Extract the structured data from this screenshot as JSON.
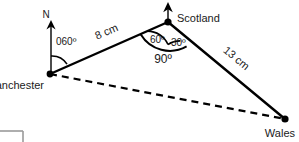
{
  "diagram": {
    "type": "bearings-triangle",
    "background_color": "#ffffff",
    "stroke_color": "#000000",
    "text_color": "#1a1a1a",
    "corner_mark_color": "#9a9a9a",
    "vertices": [
      {
        "id": "manchester",
        "label": "Manchester",
        "x": 50,
        "y": 74
      },
      {
        "id": "scotland",
        "label": "Scotland",
        "x": 168,
        "y": 22
      },
      {
        "id": "wales",
        "label": "Wales",
        "x": 285,
        "y": 119
      }
    ],
    "edges": [
      {
        "id": "manchester-scotland",
        "from": "manchester",
        "to": "scotland",
        "style": "solid",
        "length_label": "8 cm"
      },
      {
        "id": "scotland-wales",
        "from": "scotland",
        "to": "wales",
        "style": "solid",
        "length_label": "13 cm"
      },
      {
        "id": "manchester-wales",
        "from": "manchester",
        "to": "wales",
        "style": "dashed",
        "length_label": ""
      }
    ],
    "north_arrows": [
      {
        "id": "north-manchester",
        "at": "manchester",
        "label": "N"
      },
      {
        "id": "north-scotland",
        "at": "scotland",
        "label": ""
      }
    ],
    "angles": [
      {
        "id": "bearing-060",
        "at": "manchester",
        "label": "060º"
      },
      {
        "id": "angle-60",
        "at": "scotland",
        "label": "60º"
      },
      {
        "id": "angle-30",
        "at": "scotland",
        "label": "30º"
      },
      {
        "id": "angle-90-total",
        "at": "scotland",
        "label": "90º"
      }
    ]
  }
}
